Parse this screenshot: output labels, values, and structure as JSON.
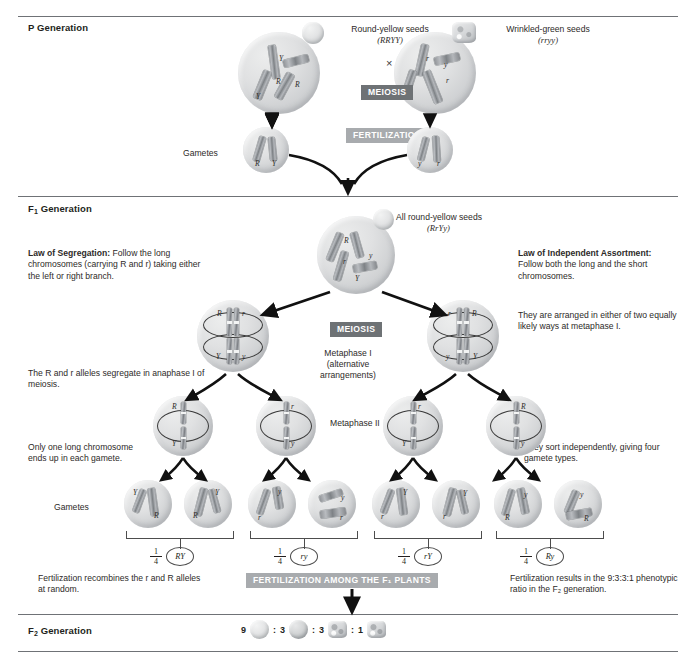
{
  "figure": {
    "sections": {
      "p_generation": "P Generation",
      "f1_generation": "F₁ Generation",
      "f2_generation": "F₂ Generation"
    },
    "banners": {
      "meiosis_p": "MEIOSIS",
      "fertilization_p": "FERTILIZATION",
      "meiosis_f1": "MEIOSIS",
      "fertilization_f1": "FERTILIZATION AMONG THE F₁ PLANTS"
    },
    "p_generation": {
      "parent_left": {
        "phenotype": "Round-yellow seeds",
        "genotype": "(RRYY)",
        "seed_icon": "round-seed-icon"
      },
      "parent_right": {
        "phenotype": "Wrinkled-green seeds",
        "genotype": "(rryy)",
        "seed_icon": "wrinkled-seed-icon"
      },
      "cross_symbol": "×",
      "gametes_label": "Gametes",
      "gamete_left_alleles": [
        "R",
        "Y"
      ],
      "gamete_right_alleles": [
        "y",
        "r"
      ],
      "parent_left_alleles": [
        "Y",
        "Y",
        "R",
        "R"
      ],
      "parent_right_alleles": [
        "r",
        "y",
        "y",
        "r"
      ]
    },
    "f1_generation": {
      "offspring_phenotype": "All round-yellow seeds",
      "offspring_genotype": "(RrYy)",
      "offspring_alleles": [
        "R",
        "r",
        "Y",
        "y"
      ],
      "law_segregation": {
        "title": "Law of Segregation:",
        "body": " Follow the long chromosomes (carrying R and r) taking either the left or right branch."
      },
      "law_independent_assortment": {
        "title": "Law of Independent Assortment:",
        "body": "  Follow both the long and the short chromosomes."
      },
      "note_anaphase": "The R and r alleles segregate in anaphase I of meiosis.",
      "note_one_long": "Only one long chromosome ends up in each gamete.",
      "note_arranged": "They are arranged in either of two equally likely ways at metaphase I.",
      "note_sort": "They sort independently, giving four gamete types.",
      "note_recombine": "Fertilization recombines the r and R alleles at random.",
      "note_ratio": "Fertilization results in the 9:3:3:1 phenotypic ratio in the F₂ generation.",
      "metaphase_i_label": "Metaphase I",
      "metaphase_i_sub1": "(alternative",
      "metaphase_i_sub2": "arrangements)",
      "metaphase_ii_label": "Metaphase II",
      "gametes_label": "Gametes",
      "metaphase_i_cells": [
        {
          "top_left": "R",
          "top_right": "r",
          "bottom_left": "Y",
          "bottom_right": "y"
        },
        {
          "top_left": "r",
          "top_right": "R",
          "bottom_left": "Y",
          "bottom_right": "y"
        }
      ],
      "metaphase_ii_cells": [
        {
          "top": "R",
          "bottom": "Y"
        },
        {
          "top": "r",
          "bottom": "y"
        },
        {
          "top": "r",
          "bottom": "Y"
        },
        {
          "top": "R",
          "bottom": "y"
        }
      ],
      "gamete_cells": [
        {
          "upper": "Y",
          "lower": "R"
        },
        {
          "upper": "Y",
          "lower": "R"
        },
        {
          "upper": "y",
          "lower": "r"
        },
        {
          "upper": "y",
          "lower": "r"
        },
        {
          "upper": "Y",
          "lower": "r"
        },
        {
          "upper": "Y",
          "lower": "r"
        },
        {
          "upper": "y",
          "lower": "R"
        },
        {
          "upper": "y",
          "lower": "R"
        }
      ],
      "gamete_types": [
        {
          "fraction_num": "1",
          "fraction_den": "4",
          "genotype": "RY"
        },
        {
          "fraction_num": "1",
          "fraction_den": "4",
          "genotype": "ry"
        },
        {
          "fraction_num": "1",
          "fraction_den": "4",
          "genotype": "rY"
        },
        {
          "fraction_num": "1",
          "fraction_den": "4",
          "genotype": "Ry"
        }
      ]
    },
    "f2_generation": {
      "ratio": [
        {
          "count": "9",
          "seed": "round-light",
          "separator": ":"
        },
        {
          "count": "3",
          "seed": "round-dark",
          "separator": ":"
        },
        {
          "count": "3",
          "seed": "wrinkled-light",
          "separator": ":"
        },
        {
          "count": "1",
          "seed": "wrinkled-dark",
          "separator": ""
        }
      ]
    },
    "colors": {
      "banner_dark": "#6e7275",
      "banner_light": "#a8abae",
      "rule": "#6f7276",
      "text": "#2d2a28",
      "chromosome": "#8b8e92"
    }
  }
}
